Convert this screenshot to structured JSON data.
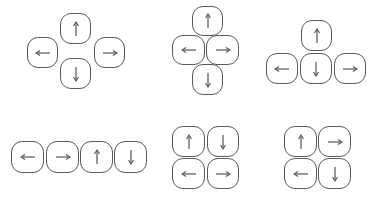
{
  "diagram": {
    "colors": {
      "border": "#5a5a5a",
      "arrow": "#555555",
      "background": "#ffffff"
    },
    "layouts": [
      {
        "name": "diamond-spread",
        "keys": [
          {
            "dir": "up",
            "x": 60,
            "y": 13,
            "w": 31,
            "h": 31
          },
          {
            "dir": "left",
            "x": 27,
            "y": 37,
            "w": 31,
            "h": 31
          },
          {
            "dir": "right",
            "x": 94,
            "y": 37,
            "w": 31,
            "h": 31
          },
          {
            "dir": "down",
            "x": 60,
            "y": 58,
            "w": 31,
            "h": 31
          }
        ]
      },
      {
        "name": "diamond-compact",
        "keys": [
          {
            "dir": "up",
            "x": 192,
            "y": 6,
            "w": 31,
            "h": 30
          },
          {
            "dir": "left",
            "x": 172,
            "y": 35,
            "w": 33,
            "h": 30
          },
          {
            "dir": "right",
            "x": 206,
            "y": 35,
            "w": 33,
            "h": 30
          },
          {
            "dir": "down",
            "x": 192,
            "y": 64,
            "w": 31,
            "h": 31
          }
        ]
      },
      {
        "name": "inverted-t",
        "keys": [
          {
            "dir": "up",
            "x": 301,
            "y": 20,
            "w": 31,
            "h": 31
          },
          {
            "dir": "left",
            "x": 266,
            "y": 53,
            "w": 32,
            "h": 31
          },
          {
            "dir": "down",
            "x": 300,
            "y": 53,
            "w": 32,
            "h": 31
          },
          {
            "dir": "right",
            "x": 334,
            "y": 53,
            "w": 32,
            "h": 31
          }
        ]
      },
      {
        "name": "single-row",
        "keys": [
          {
            "dir": "left",
            "x": 11,
            "y": 141,
            "w": 33,
            "h": 32
          },
          {
            "dir": "right",
            "x": 46,
            "y": 141,
            "w": 33,
            "h": 32
          },
          {
            "dir": "up",
            "x": 80,
            "y": 141,
            "w": 33,
            "h": 32
          },
          {
            "dir": "down",
            "x": 114,
            "y": 141,
            "w": 33,
            "h": 32
          }
        ]
      },
      {
        "name": "grid-up-down-left-right",
        "keys": [
          {
            "dir": "up",
            "x": 172,
            "y": 126,
            "w": 33,
            "h": 31
          },
          {
            "dir": "down",
            "x": 207,
            "y": 126,
            "w": 32,
            "h": 31
          },
          {
            "dir": "left",
            "x": 172,
            "y": 158,
            "w": 33,
            "h": 31
          },
          {
            "dir": "right",
            "x": 207,
            "y": 158,
            "w": 32,
            "h": 31
          }
        ]
      },
      {
        "name": "grid-up-right-left-down",
        "keys": [
          {
            "dir": "up",
            "x": 284,
            "y": 126,
            "w": 33,
            "h": 31
          },
          {
            "dir": "right",
            "x": 318,
            "y": 126,
            "w": 33,
            "h": 31
          },
          {
            "dir": "left",
            "x": 284,
            "y": 158,
            "w": 33,
            "h": 31
          },
          {
            "dir": "down",
            "x": 318,
            "y": 158,
            "w": 33,
            "h": 31
          }
        ]
      }
    ],
    "arrow_icons": {
      "up": "arrow-up-icon",
      "down": "arrow-down-icon",
      "left": "arrow-left-icon",
      "right": "arrow-right-icon"
    }
  }
}
